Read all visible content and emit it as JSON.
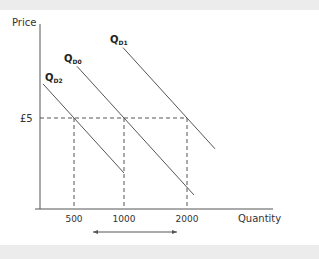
{
  "chart_data": {
    "type": "line",
    "title": "",
    "xlabel": "Quantity",
    "ylabel": "Price",
    "price_level": {
      "label": "£5",
      "value": 5
    },
    "x_ticks": [
      {
        "label": "500",
        "value": 500
      },
      {
        "label": "1000",
        "value": 1000
      },
      {
        "label": "2000",
        "value": 2000
      }
    ],
    "series": [
      {
        "name": "QD2",
        "label_main": "Q",
        "label_sub": "D2",
        "quantity_at_price": 500
      },
      {
        "name": "QD0",
        "label_main": "Q",
        "label_sub": "D0",
        "quantity_at_price": 1000
      },
      {
        "name": "QD1",
        "label_main": "Q",
        "label_sub": "D1",
        "quantity_at_price": 2000
      }
    ],
    "annotation": {
      "type": "double-arrow",
      "from": 500,
      "to": 2000,
      "description": "range of quantity demanded shifts"
    },
    "grid": false,
    "colors": {
      "curve": "#555555",
      "axis": "#555555",
      "dashed": "#555555",
      "band": "#ececec"
    }
  }
}
